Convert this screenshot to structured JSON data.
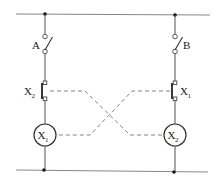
{
  "diagram": {
    "type": "interlocked relay circuit",
    "switches": [
      {
        "id": "A",
        "label": "A"
      },
      {
        "id": "B",
        "label": "B"
      }
    ],
    "contacts": [
      {
        "id": "left-contact",
        "label": "X",
        "subscript": "2"
      },
      {
        "id": "right-contact",
        "label": "X",
        "subscript": "1"
      }
    ],
    "coils": [
      {
        "id": "left-coil",
        "label": "X",
        "subscript": "1"
      },
      {
        "id": "right-coil",
        "label": "X",
        "subscript": "2"
      }
    ],
    "colors": {
      "wire": "#555555",
      "dashed_link": "#777777",
      "node": "#111111"
    }
  }
}
